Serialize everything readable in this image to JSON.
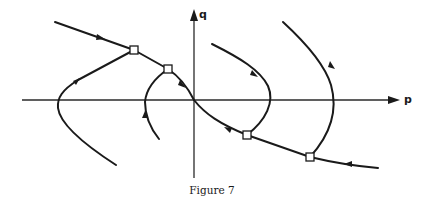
{
  "figure": {
    "caption": "Figure 7",
    "axes": {
      "horizontal_label": "p",
      "vertical_label": "q"
    },
    "colors": {
      "ink": "#1a1a1a",
      "background": "#ffffff"
    },
    "markers": [
      {
        "name": "square-marker",
        "x": 134,
        "y": 50
      },
      {
        "name": "square-marker",
        "x": 168,
        "y": 69
      },
      {
        "name": "square-marker",
        "x": 247,
        "y": 135
      },
      {
        "name": "square-marker",
        "x": 310,
        "y": 157
      }
    ]
  }
}
